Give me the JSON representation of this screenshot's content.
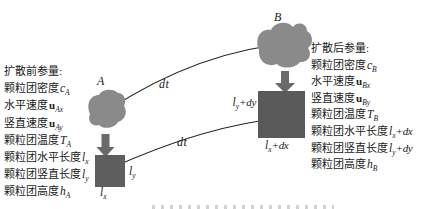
{
  "figure": {
    "left_panel": {
      "title": "扩散前参量:",
      "items": [
        {
          "label": "颗粒团密度",
          "sym": "c",
          "sub": "A"
        },
        {
          "label": "水平速度",
          "sym": "u",
          "sub": "Ax"
        },
        {
          "label": "竖直速度",
          "sym": "u",
          "sub": "Ay"
        },
        {
          "label": "颗粒团温度",
          "sym": "T",
          "sub": "A"
        },
        {
          "label": "颗粒团水平长度",
          "sym": "l",
          "sub": "x"
        },
        {
          "label": "颗粒团竖直长度",
          "sym": "l",
          "sub": "y"
        },
        {
          "label": "颗粒团高度",
          "sym": "h",
          "sub": "A"
        }
      ]
    },
    "right_panel": {
      "title": "扩散后参量:",
      "items": [
        {
          "label": "颗粒团密度",
          "sym": "c",
          "sub": "B"
        },
        {
          "label": "水平速度",
          "sym": "u",
          "sub": "Bx"
        },
        {
          "label": "竖直速度",
          "sym": "u",
          "sub": "By"
        },
        {
          "label": "颗粒团温度",
          "sym": "T",
          "sub": "B"
        },
        {
          "label": "颗粒团水平长度",
          "sym": "l",
          "sub": "x",
          "suffix": "+dx"
        },
        {
          "label": "颗粒团竖直长度",
          "sym": "l",
          "sub": "y",
          "suffix": "+dy"
        },
        {
          "label": "颗粒团高度",
          "sym": "h",
          "sub": "B"
        }
      ]
    },
    "cloud_a_label": "A",
    "cloud_b_label": "B",
    "dt_upper": "dt",
    "dt_lower": "dt",
    "small_square_labels": {
      "right": {
        "sym": "l",
        "sub": "y"
      },
      "bottom": {
        "sym": "l",
        "sub": "x"
      }
    },
    "large_square_labels": {
      "left": {
        "sym": "l",
        "sub": "y",
        "suffix": "+dy"
      },
      "bottom": {
        "sym": "l",
        "sub": "x",
        "suffix": "+dx"
      }
    },
    "colors": {
      "cloud": "#8a8a8a",
      "square_small": "#5e5e5e",
      "square_large": "#5a5a5a",
      "arrow": "#6a6a6a",
      "line": "#222222",
      "background": "#ffffff"
    }
  }
}
